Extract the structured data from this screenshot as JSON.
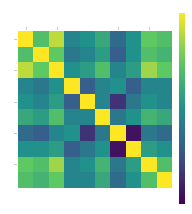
{
  "chart_data": {
    "type": "heatmap",
    "title": "",
    "xlabel": "",
    "ylabel": "",
    "colormap": "viridis",
    "colormap_stops": [
      "#440154",
      "#3b528b",
      "#21918c",
      "#5ec962",
      "#fde725"
    ],
    "vrange": [
      0,
      1
    ],
    "rows": 10,
    "cols": 10,
    "values": [
      [
        1.0,
        0.7,
        0.9,
        0.45,
        0.5,
        0.6,
        0.35,
        0.5,
        0.75,
        0.7
      ],
      [
        0.7,
        1.0,
        0.75,
        0.4,
        0.45,
        0.55,
        0.3,
        0.5,
        0.7,
        0.65
      ],
      [
        0.9,
        0.75,
        1.0,
        0.5,
        0.55,
        0.7,
        0.45,
        0.55,
        0.85,
        0.75
      ],
      [
        0.45,
        0.4,
        0.5,
        1.0,
        0.3,
        0.45,
        0.5,
        0.3,
        0.45,
        0.45
      ],
      [
        0.5,
        0.45,
        0.55,
        0.3,
        1.0,
        0.45,
        0.15,
        0.4,
        0.5,
        0.45
      ],
      [
        0.6,
        0.55,
        0.7,
        0.45,
        0.45,
        1.0,
        0.4,
        0.5,
        0.65,
        0.6
      ],
      [
        0.35,
        0.3,
        0.45,
        0.5,
        0.15,
        0.4,
        1.0,
        0.05,
        0.4,
        0.35
      ],
      [
        0.5,
        0.5,
        0.55,
        0.3,
        0.4,
        0.5,
        0.05,
        1.0,
        0.55,
        0.5
      ],
      [
        0.75,
        0.7,
        0.85,
        0.45,
        0.5,
        0.65,
        0.4,
        0.55,
        1.0,
        0.7
      ],
      [
        0.7,
        0.65,
        0.75,
        0.45,
        0.45,
        0.6,
        0.35,
        0.5,
        0.7,
        1.0
      ]
    ],
    "x_tick_positions": [
      0,
      2,
      6,
      8
    ],
    "y_tick_positions": [
      0,
      2,
      4,
      6,
      8
    ],
    "grid": false,
    "colorbar": true,
    "legend_position": "right"
  }
}
